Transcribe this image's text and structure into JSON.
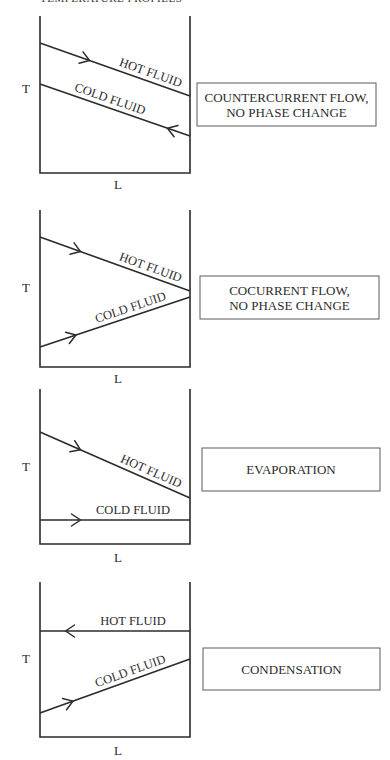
{
  "header": {
    "number": "",
    "title": "TEMPERATURE PROFILES"
  },
  "axes": {
    "y_label": "T",
    "x_label": "L"
  },
  "colors": {
    "line": "#2b2b2b",
    "box_border": "#5a5a5a",
    "background": "#ffffff"
  },
  "panels": [
    {
      "id": "countercurrent",
      "frame": {
        "left": 40,
        "right": 190,
        "top": 16,
        "bottom": 173
      },
      "t_label": {
        "x": 22,
        "y": 93
      },
      "l_label": {
        "x": 114,
        "y": 189
      },
      "hot": {
        "label": "HOT FLUID",
        "x1": 40,
        "y1": 43,
        "x2": 190,
        "y2": 96,
        "direction": "right",
        "arrow_at": 0.33
      },
      "cold": {
        "label": "COLD FLUID",
        "x1": 40,
        "y1": 84,
        "x2": 190,
        "y2": 136,
        "direction": "left",
        "arrow_at": 0.85
      },
      "box": {
        "x": 197,
        "y": 83,
        "w": 179,
        "h": 43,
        "lines": [
          "COUNTERCURRENT FLOW,",
          "NO PHASE CHANGE"
        ]
      }
    },
    {
      "id": "cocurrent",
      "frame": {
        "left": 40,
        "right": 190,
        "top": 210,
        "bottom": 367
      },
      "t_label": {
        "x": 22,
        "y": 292
      },
      "l_label": {
        "x": 114,
        "y": 383
      },
      "hot": {
        "label": "HOT FLUID",
        "x1": 40,
        "y1": 237,
        "x2": 190,
        "y2": 291,
        "direction": "right",
        "arrow_at": 0.27
      },
      "cold": {
        "label": "COLD FLUID",
        "x1": 40,
        "y1": 347,
        "x2": 190,
        "y2": 297,
        "direction": "right",
        "arrow_at": 0.24
      },
      "box": {
        "x": 200,
        "y": 276,
        "w": 179,
        "h": 43,
        "lines": [
          "COCURRENT FLOW,",
          "NO PHASE CHANGE"
        ]
      }
    },
    {
      "id": "evaporation",
      "frame": {
        "left": 40,
        "right": 190,
        "top": 389,
        "bottom": 544
      },
      "t_label": {
        "x": 22,
        "y": 471
      },
      "l_label": {
        "x": 114,
        "y": 562
      },
      "hot": {
        "label": "HOT FLUID",
        "x1": 40,
        "y1": 432,
        "x2": 190,
        "y2": 498,
        "direction": "right",
        "arrow_at": 0.27
      },
      "cold": {
        "label": "COLD FLUID",
        "x1": 40,
        "y1": 520,
        "x2": 190,
        "y2": 520,
        "direction": "right",
        "arrow_at": 0.27
      },
      "box": {
        "x": 202,
        "y": 448,
        "w": 178,
        "h": 43,
        "lines": [
          "EVAPORATION"
        ]
      }
    },
    {
      "id": "condensation",
      "frame": {
        "left": 40,
        "right": 190,
        "top": 582,
        "bottom": 737
      },
      "t_label": {
        "x": 22,
        "y": 663
      },
      "l_label": {
        "x": 114,
        "y": 755
      },
      "hot": {
        "label": "HOT FLUID",
        "x1": 40,
        "y1": 631,
        "x2": 190,
        "y2": 631,
        "direction": "left",
        "arrow_at": 0.17
      },
      "cold": {
        "label": "COLD FLUID",
        "x1": 40,
        "y1": 713,
        "x2": 190,
        "y2": 659,
        "direction": "right",
        "arrow_at": 0.22
      },
      "box": {
        "x": 203,
        "y": 648,
        "w": 177,
        "h": 42,
        "lines": [
          "CONDENSATION"
        ]
      }
    }
  ]
}
